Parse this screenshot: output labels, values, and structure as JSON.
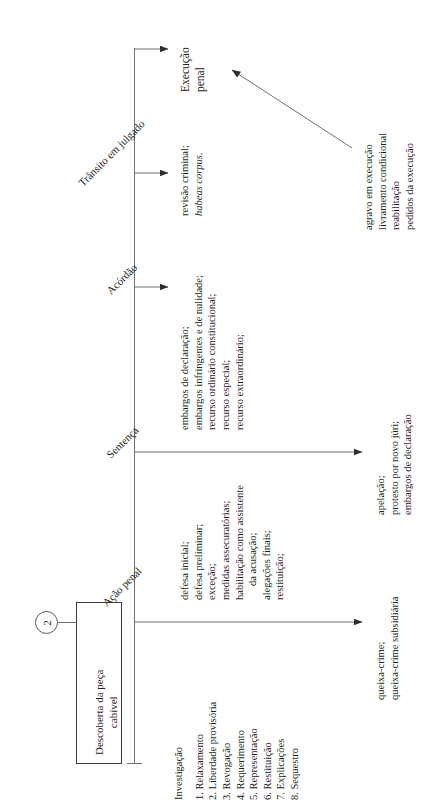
{
  "diagram": {
    "title_box": {
      "line1": "Descoberta da peça",
      "line2": "cabível",
      "connector_badge": "2"
    },
    "stage_labels": [
      {
        "name": "acao-penal",
        "text": "Ação penal"
      },
      {
        "name": "sentenca",
        "text": "Sentença"
      },
      {
        "name": "acordao",
        "text": "Acórdão"
      },
      {
        "name": "transito-julgado",
        "text": "Trânsito em julgado"
      }
    ],
    "stage_upper_notes": {
      "acao_penal": [
        "defesa inicial;",
        "defesa preliminar;",
        "exceção;",
        "medidas assecuratórias;",
        "habilitação como assistente",
        "da acusação;",
        "alegações finais;",
        "restituição;"
      ],
      "investigacao_heading": "Investigação",
      "investigacao_items": [
        "1. Relaxamento",
        "2. Liberdade provisória",
        "3. Revogação",
        "4. Requerimento",
        "5. Representação",
        "6. Restituição",
        "7. Explicações",
        "8. Sequestro"
      ],
      "sentenca": [
        "embargos de declaração;",
        "embargos infringentes e de nulidade;",
        "recurso ordinário constitucional;",
        "recurso especial;",
        "recurso extraordinário;"
      ],
      "acordao": [
        "revisão criminal;",
        "habeas corpus."
      ],
      "transito": [
        "Execução",
        "penal"
      ]
    },
    "stage_lower_notes": {
      "acao_penal": [
        "queixa-crime;",
        "queixa-crime subsidiária"
      ],
      "sentenca": [
        "apelação;",
        "protesto por novo júri;",
        "embargos de declaração"
      ],
      "execucao": [
        "agravo em execução",
        "livramento condicional",
        "reabilitação",
        "pedidos da execução"
      ]
    },
    "colors": {
      "stroke": "#6f6f6f",
      "box_border": "#3a3a3a",
      "text": "#1d1d1d",
      "background": "#ffffff"
    }
  }
}
